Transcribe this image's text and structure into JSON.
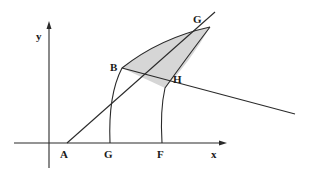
{
  "diagram": {
    "colors": {
      "stroke": "#2a2a2a",
      "shaded_region": "#d6d6d6",
      "background": "#ffffff"
    },
    "axes": {
      "x_label": "x",
      "y_label": "y"
    },
    "points": {
      "A": "A",
      "G_base": "G",
      "F": "F",
      "B": "B",
      "H": "H",
      "G_top": "G"
    }
  }
}
